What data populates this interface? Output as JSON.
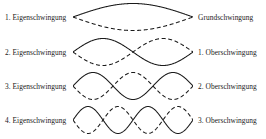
{
  "figure": {
    "stroke_color": "#1a1a1a",
    "background_color": "#ffffff",
    "rows": [
      {
        "left_label": "1. Eigenschwingung",
        "right_label": "Grundschwingung",
        "half_waves": 1
      },
      {
        "left_label": "2. Eigenschwingung",
        "right_label": "1. Oberschwingung",
        "half_waves": 2
      },
      {
        "left_label": "3. Eigenschwingung",
        "right_label": "2. Oberschwingung",
        "half_waves": 3
      },
      {
        "left_label": "4. Eigenschwingung",
        "right_label": "3. Oberschwingung",
        "half_waves": 4
      }
    ]
  },
  "chart_data": {
    "type": "line",
    "xlabel": "",
    "ylabel": "",
    "xlim": [
      0,
      1
    ],
    "ylim": [
      -1,
      1
    ],
    "grid": false,
    "legend": "none",
    "annotations": [
      "1. Eigenschwingung",
      "Grundschwingung",
      "2. Eigenschwingung",
      "1. Oberschwingung",
      "3. Eigenschwingung",
      "2. Oberschwingung",
      "4. Eigenschwingung",
      "3. Oberschwingung"
    ],
    "series": [
      {
        "name": "1. Eigenschwingung (solid)",
        "mode": 1,
        "phase": "positive",
        "style": "solid",
        "formula": "y = sin(1*pi*x)"
      },
      {
        "name": "1. Eigenschwingung (dashed)",
        "mode": 1,
        "phase": "inverted",
        "style": "dashed",
        "formula": "y = -sin(1*pi*x)"
      },
      {
        "name": "2. Eigenschwingung (solid)",
        "mode": 2,
        "phase": "positive",
        "style": "solid",
        "formula": "y = sin(2*pi*x)"
      },
      {
        "name": "2. Eigenschwingung (dashed)",
        "mode": 2,
        "phase": "inverted",
        "style": "dashed",
        "formula": "y = -sin(2*pi*x)"
      },
      {
        "name": "3. Eigenschwingung (solid)",
        "mode": 3,
        "phase": "positive",
        "style": "solid",
        "formula": "y = sin(3*pi*x)"
      },
      {
        "name": "3. Eigenschwingung (dashed)",
        "mode": 3,
        "phase": "inverted",
        "style": "dashed",
        "formula": "y = -sin(3*pi*x)"
      },
      {
        "name": "4. Eigenschwingung (solid)",
        "mode": 4,
        "phase": "positive",
        "style": "solid",
        "formula": "y = sin(4*pi*x)"
      },
      {
        "name": "4. Eigenschwingung (dashed)",
        "mode": 4,
        "phase": "inverted",
        "style": "dashed",
        "formula": "y = -sin(4*pi*x)"
      }
    ]
  }
}
